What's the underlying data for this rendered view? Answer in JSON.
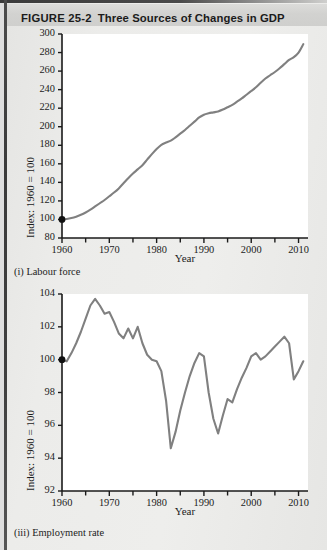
{
  "figure": {
    "number": "FIGURE 25-2",
    "title": "Three Sources of Changes in GDP"
  },
  "colors": {
    "line": "#808080",
    "axis": "#1a1a1a",
    "plot_background": "#ffffff",
    "page_background": "#ececea",
    "title_band": "#d3d3d1"
  },
  "chart_data": [
    {
      "type": "line",
      "title": "(i) Labour force",
      "panel": "i",
      "xlabel": "Year",
      "ylabel": "Index: 1960 = 100",
      "xlim": [
        1960,
        2012
      ],
      "ylim": [
        80,
        300
      ],
      "ytick_step": 20,
      "yticks": [
        80,
        100,
        120,
        140,
        160,
        180,
        200,
        220,
        240,
        260,
        280,
        300
      ],
      "xticks": [
        1960,
        1970,
        1980,
        1990,
        2000,
        2010
      ],
      "xminor_step": 5,
      "grid": false,
      "legend": null,
      "start_marker": {
        "x": 1960,
        "y": 100,
        "shape": "filled-circle"
      },
      "x": [
        1960,
        1961,
        1962,
        1963,
        1964,
        1965,
        1966,
        1967,
        1968,
        1969,
        1970,
        1971,
        1972,
        1973,
        1974,
        1975,
        1976,
        1977,
        1978,
        1979,
        1980,
        1981,
        1982,
        1983,
        1984,
        1985,
        1986,
        1987,
        1988,
        1989,
        1990,
        1991,
        1992,
        1993,
        1994,
        1995,
        1996,
        1997,
        1998,
        1999,
        2000,
        2001,
        2002,
        2003,
        2004,
        2005,
        2006,
        2007,
        2008,
        2009,
        2010,
        2011
      ],
      "values": [
        100,
        100.5,
        101.5,
        103,
        105,
        107.5,
        110.5,
        114,
        117.5,
        121,
        125,
        129,
        133.5,
        139,
        144.5,
        149.5,
        154,
        158.5,
        164.5,
        170.5,
        176,
        180.5,
        183,
        185,
        188.5,
        192.5,
        196.5,
        201,
        205.5,
        210,
        213,
        214.5,
        215.5,
        216.5,
        218.5,
        221,
        223.5,
        227,
        230.5,
        234.5,
        238.5,
        242.5,
        247.5,
        252,
        255.5,
        259,
        263,
        267.5,
        272,
        275,
        280,
        289
      ]
    },
    {
      "type": "line",
      "title": "(iii) Employment rate",
      "panel": "iii",
      "xlabel": "Year",
      "ylabel": "Index: 1960 = 100",
      "xlim": [
        1960,
        2012
      ],
      "ylim": [
        92,
        104
      ],
      "ytick_step": 2,
      "yticks": [
        92,
        94,
        96,
        98,
        100,
        102,
        104
      ],
      "xticks": [
        1960,
        1970,
        1980,
        1990,
        2000,
        2010
      ],
      "xminor_step": 5,
      "grid": false,
      "legend": null,
      "start_marker": {
        "x": 1960,
        "y": 100,
        "shape": "filled-circle"
      },
      "x": [
        1960,
        1961,
        1962,
        1963,
        1964,
        1965,
        1966,
        1967,
        1968,
        1969,
        1970,
        1971,
        1972,
        1973,
        1974,
        1975,
        1976,
        1977,
        1978,
        1979,
        1980,
        1981,
        1982,
        1983,
        1984,
        1985,
        1986,
        1987,
        1988,
        1989,
        1990,
        1991,
        1992,
        1993,
        1994,
        1995,
        1996,
        1997,
        1998,
        1999,
        2000,
        2001,
        2002,
        2003,
        2004,
        2005,
        2006,
        2007,
        2008,
        2009,
        2010,
        2011
      ],
      "values": [
        100,
        99.9,
        100.4,
        101.0,
        101.7,
        102.5,
        103.3,
        103.7,
        103.3,
        102.8,
        102.9,
        102.3,
        101.6,
        101.3,
        101.9,
        101.3,
        102.0,
        101.0,
        100.3,
        100.0,
        99.9,
        99.3,
        97.5,
        94.6,
        95.6,
        96.9,
        98.0,
        99.0,
        99.8,
        100.4,
        100.2,
        98.0,
        96.4,
        95.5,
        96.6,
        97.6,
        97.4,
        98.2,
        98.9,
        99.5,
        100.2,
        100.4,
        100.0,
        100.2,
        100.5,
        100.8,
        101.1,
        101.4,
        101.0,
        98.8,
        99.3,
        99.9
      ]
    }
  ]
}
